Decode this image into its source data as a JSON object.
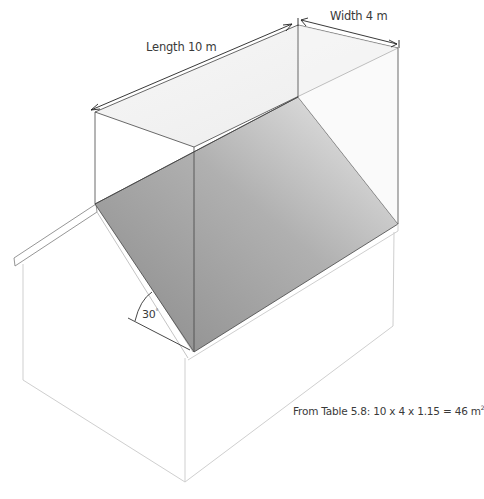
{
  "diagram": {
    "type": "isometric roof area diagram",
    "dimensions": {
      "length_label": "Length 10 m",
      "width_label": "Width 4 m"
    },
    "angle": {
      "value": "30",
      "unit": "°"
    },
    "formula": {
      "text": "From Table 5.8: 10 x 4 x 1.15 = 46 m",
      "superscript": "2"
    },
    "colors": {
      "roof_dark": "#8e8e8e",
      "roof_light": "#e4e4e4",
      "box_top": "#f1f1f1",
      "lines": "#333333",
      "house_lines": "#c8c8c8"
    }
  }
}
